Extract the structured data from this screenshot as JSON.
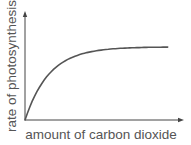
{
  "chart_data": {
    "type": "line",
    "title": "",
    "xlabel": "amount of carbon dioxide",
    "ylabel": "rate of photosynthesis",
    "x_ticks": [],
    "y_ticks": [],
    "grid": false,
    "legend": null,
    "series": [
      {
        "name": "rate of photosynthesis",
        "x": [
          0,
          0.05,
          0.1,
          0.2,
          0.3,
          0.4,
          0.5,
          0.6,
          0.7,
          0.8,
          0.9,
          1.0
        ],
        "y": [
          0,
          0.28,
          0.48,
          0.72,
          0.86,
          0.94,
          0.98,
          1.0,
          1.0,
          1.0,
          1.0,
          1.0
        ]
      }
    ],
    "xlim": [
      0,
      1.1
    ],
    "ylim": [
      0,
      1.45
    ]
  },
  "labels": {
    "x_axis": "amount of carbon dioxide",
    "y_axis": "rate of photosynthesis"
  },
  "colors": {
    "axis": "#444444",
    "curve": "#555555",
    "text": "#555555"
  }
}
